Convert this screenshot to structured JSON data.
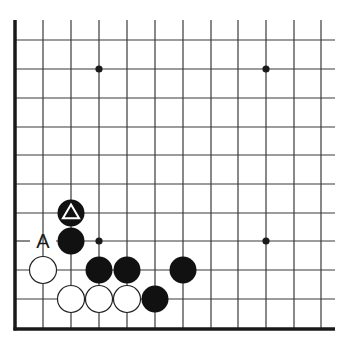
{
  "board": {
    "background": "#ffffff",
    "line_color": "#3a3a3a",
    "cols_x": [
      15,
      43,
      71,
      99,
      127,
      155,
      183,
      211,
      238,
      266,
      294,
      321
    ],
    "rows_y": [
      40,
      69,
      98,
      127,
      155,
      184,
      213,
      241,
      270,
      299,
      329
    ],
    "top_open_y": 20,
    "right_open_x": 335,
    "left_edge_x": 15,
    "bottom_edge_y": 329,
    "visible_edges": [
      "left",
      "bottom"
    ],
    "stone_radius": 13.5
  },
  "star_points": [
    {
      "col": 3,
      "row": 1
    },
    {
      "col": 9,
      "row": 1
    },
    {
      "col": 3,
      "row": 7
    },
    {
      "col": 9,
      "row": 7
    }
  ],
  "stones": [
    {
      "color": "black",
      "col": 2,
      "row": 6,
      "marker": "triangle"
    },
    {
      "color": "black",
      "col": 2,
      "row": 7
    },
    {
      "color": "white",
      "col": 1,
      "row": 8
    },
    {
      "color": "black",
      "col": 3,
      "row": 8
    },
    {
      "color": "black",
      "col": 4,
      "row": 8
    },
    {
      "color": "black",
      "col": 6,
      "row": 8
    },
    {
      "color": "white",
      "col": 2,
      "row": 9
    },
    {
      "color": "white",
      "col": 3,
      "row": 9
    },
    {
      "color": "white",
      "col": 4,
      "row": 9
    },
    {
      "color": "black",
      "col": 5,
      "row": 9
    }
  ],
  "labels": [
    {
      "text": "A",
      "col": 1,
      "row": 7
    }
  ]
}
